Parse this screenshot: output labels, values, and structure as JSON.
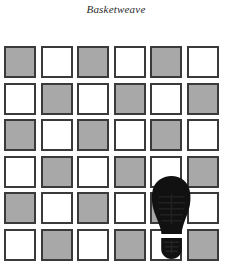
{
  "figure": {
    "caption": "Basketweave",
    "type": "checkerboard-tile-pattern-with-shoe-overlay"
  },
  "grid": {
    "rows": 6,
    "columns": 6,
    "cell_size": 32,
    "cell_pitch": 36.5,
    "origin_x": 4,
    "origin_y": 46,
    "colors": {
      "gray": "#a8a8a8",
      "white": "#ffffff",
      "border": "#3a3a3a",
      "background": "#ffffff"
    },
    "pattern_start": "gray",
    "tiles": [
      [
        "gray",
        "white",
        "gray",
        "white",
        "gray",
        "white"
      ],
      [
        "white",
        "gray",
        "white",
        "gray",
        "white",
        "gray"
      ],
      [
        "gray",
        "white",
        "gray",
        "white",
        "gray",
        "white"
      ],
      [
        "white",
        "gray",
        "white",
        "gray",
        "white",
        "gray"
      ],
      [
        "gray",
        "white",
        "gray",
        "white",
        "gray",
        "white"
      ],
      [
        "white",
        "gray",
        "white",
        "gray",
        "white",
        "gray"
      ]
    ]
  },
  "overlay": {
    "icon": "shoe-sole-icon",
    "label": "shoe sole footprint",
    "color": "#111111",
    "position": {
      "column": 5,
      "rows": [
        4,
        5,
        6
      ],
      "center_x": 171,
      "top_y": 176,
      "bottom_y": 259,
      "forefoot_width": 38
    }
  }
}
